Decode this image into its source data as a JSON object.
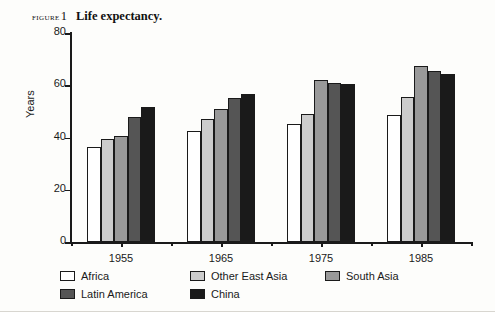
{
  "caption": {
    "figure_label": "FIGURE",
    "figure_number": "1",
    "title": "Life expectancy."
  },
  "axes": {
    "ylabel": "Years",
    "yticks": [
      "0",
      "20",
      "40",
      "60",
      "80"
    ],
    "xticks": [
      "1955",
      "1965",
      "1975",
      "1985"
    ]
  },
  "colors": {
    "africa": "#ffffff",
    "other_east_asia": "#cccccc",
    "south_asia": "#999999",
    "latin_america": "#555555",
    "china": "#1a1a1a",
    "axis": "#1a1a1a",
    "background": "#fdfdfb"
  },
  "legend": {
    "rows": [
      [
        {
          "label": "Africa",
          "key": "africa"
        },
        {
          "label": "Other East Asia",
          "key": "other_east_asia"
        },
        {
          "label": "South Asia",
          "key": "south_asia"
        }
      ],
      [
        {
          "label": "Latin America",
          "key": "latin_america"
        },
        {
          "label": "China",
          "key": "china"
        }
      ]
    ]
  },
  "chart_data": {
    "type": "bar",
    "title": "Life expectancy.",
    "xlabel": "",
    "ylabel": "Years",
    "ylim": [
      0,
      80
    ],
    "ytick_step": 20,
    "grid": false,
    "legend_position": "bottom-left",
    "categories": [
      "1955",
      "1965",
      "1975",
      "1985"
    ],
    "series": [
      {
        "name": "Africa",
        "color": "#ffffff",
        "values": [
          36.5,
          42.5,
          45.0,
          48.5
        ]
      },
      {
        "name": "Other East Asia",
        "color": "#cccccc",
        "values": [
          39.5,
          47.0,
          49.0,
          55.5
        ]
      },
      {
        "name": "South Asia",
        "color": "#999999",
        "values": [
          40.5,
          51.0,
          62.0,
          67.5
        ]
      },
      {
        "name": "Latin America",
        "color": "#555555",
        "values": [
          48.0,
          55.0,
          61.0,
          65.5
        ]
      },
      {
        "name": "China",
        "color": "#1a1a1a",
        "values": [
          51.5,
          56.5,
          60.5,
          64.5
        ]
      }
    ]
  }
}
